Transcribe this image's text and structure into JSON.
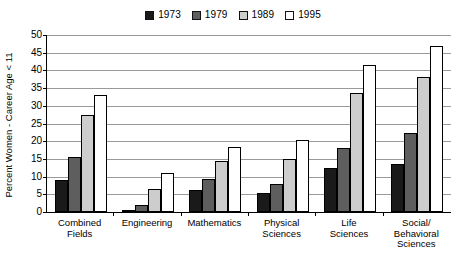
{
  "chart_data": {
    "type": "bar",
    "title": "",
    "xlabel": "",
    "ylabel": "Percent Women - Career Age < 11",
    "ylim": [
      0,
      50
    ],
    "yticks": [
      0,
      5,
      10,
      15,
      20,
      25,
      30,
      35,
      40,
      45,
      50
    ],
    "grid": true,
    "legend_position": "top-center",
    "categories": [
      "Combined Fields",
      "Engineering",
      "Mathematics",
      "Physical Sciences",
      "Life Sciences",
      "Social/Behavioral Sciences"
    ],
    "category_lines": [
      [
        "Combined",
        "Fields"
      ],
      [
        "Engineering"
      ],
      [
        "Mathematics"
      ],
      [
        "Physical",
        "Sciences"
      ],
      [
        "Life",
        "Sciences"
      ],
      [
        "Social/",
        "Behavioral",
        "Sciences"
      ]
    ],
    "series": [
      {
        "name": "1973",
        "color": "#1a1a1a",
        "values": [
          9.0,
          0.5,
          6.3,
          5.3,
          12.3,
          13.5
        ]
      },
      {
        "name": "1979",
        "color": "#5e5e5e",
        "values": [
          15.5,
          2.1,
          9.3,
          7.8,
          18.0,
          22.3
        ]
      },
      {
        "name": "1989",
        "color": "#cdcdcd",
        "values": [
          27.4,
          6.6,
          14.5,
          15.0,
          33.5,
          38.0
        ]
      },
      {
        "name": "1995",
        "color": "#ffffff",
        "values": [
          33.0,
          11.0,
          18.5,
          20.3,
          41.5,
          46.8
        ]
      }
    ]
  }
}
